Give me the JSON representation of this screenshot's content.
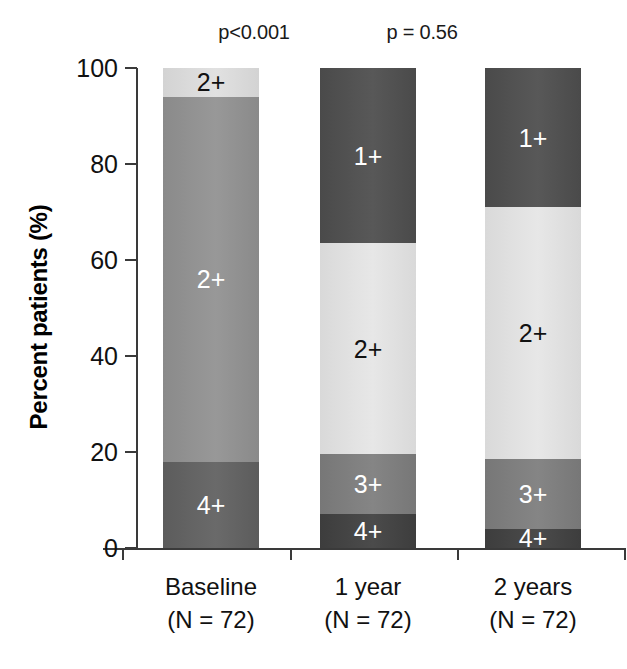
{
  "chart_data": {
    "type": "bar",
    "subtype": "stacked-bar-100",
    "title": "",
    "xlabel": "",
    "ylabel": "Percent patients (%)",
    "ylim": [
      0,
      100
    ],
    "yticks": [
      0,
      20,
      40,
      60,
      80,
      100
    ],
    "ytick_labels": [
      "0",
      "20",
      "40",
      "60",
      "80",
      "100"
    ],
    "grid": false,
    "legend": false,
    "categories": [
      "Baseline",
      "1 year",
      "2 years"
    ],
    "category_sublabels": [
      "(N = 72)",
      "(N = 72)",
      "(N = 72)"
    ],
    "annotations": [
      {
        "text": "p<0.001",
        "over_category": "1 year"
      },
      {
        "text": "p = 0.56",
        "over_category": "2 years"
      }
    ],
    "bars": [
      {
        "category": "Baseline",
        "sublabel": "(N = 72)",
        "segments": [
          {
            "label": "2+",
            "value": 6,
            "from": 94,
            "to": 100,
            "color": "#d3d3d3",
            "label_color": "#111111"
          },
          {
            "label": "2+",
            "value": 76,
            "from": 18,
            "to": 94,
            "color": "#8a8a8a",
            "label_color": "#ffffff"
          },
          {
            "label": "4+",
            "value": 18,
            "from": 0,
            "to": 18,
            "color": "#5c5c5c",
            "label_color": "#ffffff"
          }
        ]
      },
      {
        "category": "1 year",
        "sublabel": "(N = 72)",
        "segments": [
          {
            "label": "1+",
            "value": 36.5,
            "from": 63.5,
            "to": 100,
            "color": "#4a4a4a",
            "label_color": "#ffffff"
          },
          {
            "label": "2+",
            "value": 44,
            "from": 19.5,
            "to": 63.5,
            "color": "#d9d9d9",
            "label_color": "#111111"
          },
          {
            "label": "3+",
            "value": 12.5,
            "from": 7,
            "to": 19.5,
            "color": "#777777",
            "label_color": "#ffffff"
          },
          {
            "label": "4+",
            "value": 7,
            "from": 0,
            "to": 7,
            "color": "#3d3d3d",
            "label_color": "#ffffff"
          }
        ]
      },
      {
        "category": "2 years",
        "sublabel": "(N = 72)",
        "segments": [
          {
            "label": "1+",
            "value": 29,
            "from": 71,
            "to": 100,
            "color": "#4a4a4a",
            "label_color": "#ffffff"
          },
          {
            "label": "2+",
            "value": 52.5,
            "from": 18.5,
            "to": 71,
            "color": "#d9d9d9",
            "label_color": "#111111"
          },
          {
            "label": "3+",
            "value": 14.5,
            "from": 4,
            "to": 18.5,
            "color": "#777777",
            "label_color": "#ffffff"
          },
          {
            "label": "4+",
            "value": 4,
            "from": 0,
            "to": 4,
            "color": "#3d3d3d",
            "label_color": "#ffffff"
          }
        ]
      }
    ]
  },
  "axis": {
    "y_title": "Percent patients (%)",
    "y_tick_labels": [
      "100",
      "80",
      "60",
      "40",
      "20",
      "0"
    ]
  }
}
